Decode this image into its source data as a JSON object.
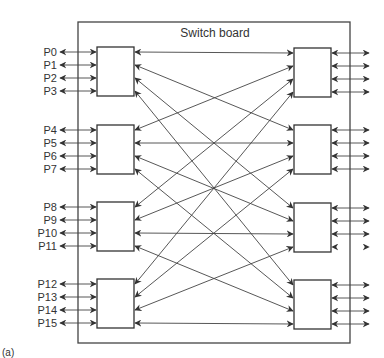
{
  "diagram": {
    "board_title": "Switch board",
    "caption": "(a)",
    "left_ports": [
      "P0",
      "P1",
      "P2",
      "P3",
      "P4",
      "P5",
      "P6",
      "P7",
      "P8",
      "P9",
      "P10",
      "P11",
      "P12",
      "P13",
      "P14",
      "P15"
    ],
    "switch_count_per_side": 4,
    "ports_per_switch": 4,
    "interconnect_rule": "left switch i, port j <-> right switch j, port i",
    "right_external_missing_line": {
      "switch": 2,
      "port": 3
    },
    "colors": {
      "line": "#444444",
      "box": "#333333",
      "text": "#333333",
      "background": "#ffffff"
    }
  }
}
